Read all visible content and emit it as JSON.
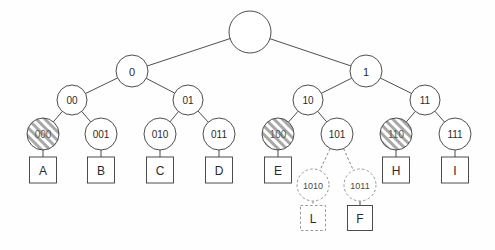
{
  "diagram": {
    "type": "binary-trie",
    "title": "",
    "background_color": "#fefefe",
    "stroke_color": "#3a3a3a",
    "dashed_stroke_color": "#8a8a8a",
    "hatch_color": "#9a9a9a",
    "nodes": [
      {
        "id": "root",
        "label": "",
        "x": 250,
        "y": 32,
        "r": 21,
        "style": "solid",
        "font_size": 10
      },
      {
        "id": "n0",
        "label": "0",
        "x": 132,
        "y": 71,
        "r": 16,
        "style": "solid",
        "font_size": 11
      },
      {
        "id": "n1",
        "label": "1",
        "x": 366,
        "y": 71,
        "r": 16,
        "style": "solid",
        "font_size": 11
      },
      {
        "id": "n00",
        "label": "00",
        "x": 72,
        "y": 100,
        "r": 15,
        "style": "solid",
        "font_size": 10
      },
      {
        "id": "n01",
        "label": "01",
        "x": 188,
        "y": 100,
        "r": 15,
        "style": "solid",
        "font_size": 10
      },
      {
        "id": "n10",
        "label": "10",
        "x": 308,
        "y": 100,
        "r": 15,
        "style": "solid",
        "font_size": 10
      },
      {
        "id": "n11",
        "label": "11",
        "x": 425,
        "y": 100,
        "r": 15,
        "style": "solid",
        "font_size": 10
      },
      {
        "id": "n000",
        "label": "000",
        "x": 43,
        "y": 134,
        "r": 16,
        "style": "hatched",
        "font_size": 10
      },
      {
        "id": "n001",
        "label": "001",
        "x": 101,
        "y": 134,
        "r": 16,
        "style": "solid",
        "font_size": 10
      },
      {
        "id": "n010",
        "label": "010",
        "x": 160,
        "y": 134,
        "r": 16,
        "style": "solid",
        "font_size": 10
      },
      {
        "id": "n011",
        "label": "011",
        "x": 219,
        "y": 134,
        "r": 16,
        "style": "solid",
        "font_size": 10
      },
      {
        "id": "n100",
        "label": "100",
        "x": 278,
        "y": 134,
        "r": 16,
        "style": "hatched",
        "font_size": 10
      },
      {
        "id": "n101",
        "label": "101",
        "x": 337,
        "y": 134,
        "r": 16,
        "style": "solid",
        "font_size": 10
      },
      {
        "id": "n110",
        "label": "110",
        "x": 396,
        "y": 134,
        "r": 16,
        "style": "hatched",
        "font_size": 10
      },
      {
        "id": "n111",
        "label": "111",
        "x": 455,
        "y": 134,
        "r": 16,
        "style": "solid",
        "font_size": 10
      },
      {
        "id": "n1010",
        "label": "1010",
        "x": 313,
        "y": 185,
        "r": 16,
        "style": "dashed",
        "font_size": 9
      },
      {
        "id": "n1011",
        "label": "1011",
        "x": 360,
        "y": 185,
        "r": 16,
        "style": "dashed",
        "font_size": 9
      }
    ],
    "leaves": [
      {
        "id": "leafA",
        "label": "A",
        "x": 43,
        "y": 170,
        "w": 27,
        "h": 26,
        "style": "solid"
      },
      {
        "id": "leafB",
        "label": "B",
        "x": 101,
        "y": 170,
        "w": 27,
        "h": 26,
        "style": "solid"
      },
      {
        "id": "leafC",
        "label": "C",
        "x": 160,
        "y": 170,
        "w": 27,
        "h": 26,
        "style": "solid"
      },
      {
        "id": "leafD",
        "label": "D",
        "x": 219,
        "y": 170,
        "w": 27,
        "h": 26,
        "style": "solid"
      },
      {
        "id": "leafE",
        "label": "E",
        "x": 278,
        "y": 170,
        "w": 27,
        "h": 26,
        "style": "solid"
      },
      {
        "id": "leafH",
        "label": "H",
        "x": 396,
        "y": 170,
        "w": 27,
        "h": 26,
        "style": "solid"
      },
      {
        "id": "leafI",
        "label": "I",
        "x": 455,
        "y": 170,
        "w": 27,
        "h": 26,
        "style": "solid"
      },
      {
        "id": "leafL",
        "label": "L",
        "x": 313,
        "y": 218,
        "w": 25,
        "h": 25,
        "style": "dashed"
      },
      {
        "id": "leafF",
        "label": "F",
        "x": 360,
        "y": 218,
        "w": 25,
        "h": 25,
        "style": "solid"
      }
    ],
    "edges": [
      {
        "id": "e-root-0",
        "from": "root",
        "to": "n0",
        "style": "solid"
      },
      {
        "id": "e-root-1",
        "from": "root",
        "to": "n1",
        "style": "solid"
      },
      {
        "id": "e-0-00",
        "from": "n0",
        "to": "n00",
        "style": "solid"
      },
      {
        "id": "e-0-01",
        "from": "n0",
        "to": "n01",
        "style": "solid"
      },
      {
        "id": "e-1-10",
        "from": "n1",
        "to": "n10",
        "style": "solid"
      },
      {
        "id": "e-1-11",
        "from": "n1",
        "to": "n11",
        "style": "solid"
      },
      {
        "id": "e-00-000",
        "from": "n00",
        "to": "n000",
        "style": "solid"
      },
      {
        "id": "e-00-001",
        "from": "n00",
        "to": "n001",
        "style": "solid"
      },
      {
        "id": "e-01-010",
        "from": "n01",
        "to": "n010",
        "style": "solid"
      },
      {
        "id": "e-01-011",
        "from": "n01",
        "to": "n011",
        "style": "solid"
      },
      {
        "id": "e-10-100",
        "from": "n10",
        "to": "n100",
        "style": "solid"
      },
      {
        "id": "e-10-101",
        "from": "n10",
        "to": "n101",
        "style": "solid"
      },
      {
        "id": "e-11-110",
        "from": "n11",
        "to": "n110",
        "style": "solid"
      },
      {
        "id": "e-11-111",
        "from": "n11",
        "to": "n111",
        "style": "solid"
      },
      {
        "id": "e-101-1010",
        "from": "n101",
        "to": "n1010",
        "style": "dashed"
      },
      {
        "id": "e-101-1011",
        "from": "n101",
        "to": "n1011",
        "style": "dashed"
      },
      {
        "id": "e-000-A",
        "from": "n000",
        "to": "leafA",
        "style": "solid"
      },
      {
        "id": "e-001-B",
        "from": "n001",
        "to": "leafB",
        "style": "solid"
      },
      {
        "id": "e-010-C",
        "from": "n010",
        "to": "leafC",
        "style": "solid"
      },
      {
        "id": "e-011-D",
        "from": "n011",
        "to": "leafD",
        "style": "solid"
      },
      {
        "id": "e-100-E",
        "from": "n100",
        "to": "leafE",
        "style": "solid"
      },
      {
        "id": "e-110-H",
        "from": "n110",
        "to": "leafH",
        "style": "solid"
      },
      {
        "id": "e-111-I",
        "from": "n111",
        "to": "leafI",
        "style": "solid"
      },
      {
        "id": "e-1010-L",
        "from": "n1010",
        "to": "leafL",
        "style": "dashed"
      },
      {
        "id": "e-1011-F",
        "from": "n1011",
        "to": "leafF",
        "style": "solid"
      }
    ]
  }
}
